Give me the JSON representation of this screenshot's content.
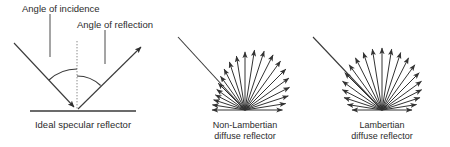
{
  "figure": {
    "background_color": "#ffffff",
    "stroke_color": "#3a3a3a",
    "text_color": "#2b2b2b",
    "panels": [
      {
        "id": "ideal-specular",
        "caption": "Ideal specular reflector",
        "annotations": [
          {
            "id": "angle-of-incidence",
            "text": "Angle of incidence"
          },
          {
            "id": "angle-of-reflection",
            "text": "Angle of reflection"
          }
        ],
        "geometry": {
          "surface": {
            "x1": 30,
            "y1": 111,
            "x2": 136,
            "y2": 111
          },
          "vertex": {
            "x": 77,
            "y": 110
          },
          "normal": {
            "x1": 77,
            "y1": 41,
            "x2": 77,
            "y2": 110,
            "style": "dotted"
          },
          "incident_ray": {
            "x1": 14,
            "y1": 43,
            "x2": 77,
            "y2": 110,
            "arrow": "end"
          },
          "reflected_ray": {
            "x1": 77,
            "y1": 110,
            "x2": 143,
            "y2": 45,
            "arrow": "end"
          },
          "incidence_arc": {
            "radius": 41,
            "from_deg": 90,
            "to_deg": 133
          },
          "reflection_arc": {
            "radius": 34,
            "from_deg": 46,
            "to_deg": 90
          }
        },
        "leaders": [
          {
            "id": "incidence-leader",
            "x1": 50,
            "y1": 14,
            "x2": 50,
            "y2": 57
          },
          {
            "id": "reflection-leader",
            "x1": 105,
            "y1": 30,
            "x2": 105,
            "y2": 64
          }
        ]
      },
      {
        "id": "non-lambertian",
        "caption_line1": "Non-Lambertian",
        "caption_line2": "diffuse reflector",
        "center": {
          "x": 245,
          "y": 110
        },
        "incident_ray": {
          "x1": 178,
          "y1": 37,
          "x2": 245,
          "y2": 110
        },
        "lobe_type": "non-lambertian",
        "ray_count": 21,
        "max_length": 62,
        "min_length": 33,
        "lobe_peak_deg": 68,
        "lobe_exponent": 1.9
      },
      {
        "id": "lambertian",
        "caption_line1": "Lambertian",
        "caption_line2": "diffuse reflector",
        "center": {
          "x": 382,
          "y": 110
        },
        "incident_ray": {
          "x1": 313,
          "y1": 37,
          "x2": 382,
          "y2": 110
        },
        "lobe_type": "lambertian",
        "ray_count": 21,
        "max_length": 62,
        "min_length": 30,
        "lobe_peak_deg": 90,
        "lobe_exponent": 1.0
      }
    ]
  }
}
